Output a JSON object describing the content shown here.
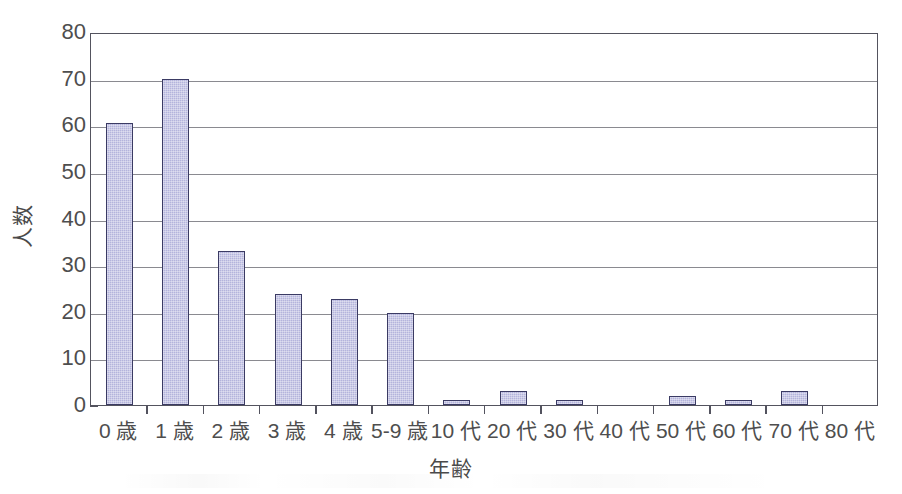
{
  "chart_data": {
    "type": "bar",
    "title": "",
    "xlabel": "年齢",
    "ylabel": "人数",
    "categories": [
      "0 歳",
      "1 歳",
      "2 歳",
      "3 歳",
      "4 歳",
      "5-9 歳",
      "10 代",
      "20 代",
      "30 代",
      "40 代",
      "50 代",
      "60 代",
      "70 代",
      "80 代"
    ],
    "values": [
      60.5,
      70,
      33,
      23.8,
      22.7,
      19.8,
      1,
      3,
      1,
      0,
      2,
      1,
      3,
      0
    ],
    "ylim": [
      0,
      80
    ],
    "ytick_labels": [
      "0",
      "10",
      "20",
      "30",
      "40",
      "50",
      "60",
      "70",
      "80"
    ],
    "ytick_values": [
      0,
      10,
      20,
      30,
      40,
      50,
      60,
      70,
      80
    ],
    "grid": "horizontal",
    "legend": "none",
    "bar_color": "#b4b4dc",
    "bar_edge_color": "#3b3b64",
    "gridline_color": "#8a8a90",
    "axis_color": "#53535e",
    "background_color": "#ffffff"
  }
}
